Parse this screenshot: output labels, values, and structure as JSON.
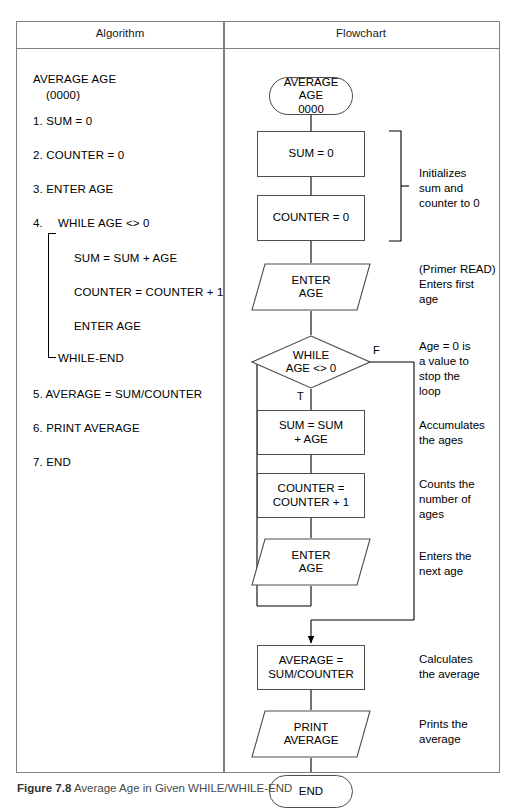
{
  "figure": {
    "caption_label": "Figure 7.8",
    "caption_text": "Average Age in Given WHILE/WHILE-END"
  },
  "table": {
    "headers": {
      "algorithm": "Algorithm",
      "flowchart": "Flowchart"
    }
  },
  "algorithm": {
    "title": "AVERAGE AGE",
    "subtitle": "(0000)",
    "steps": [
      "1. SUM = 0",
      "2. COUNTER = 0",
      "3. ENTER AGE",
      "4.",
      "WHILE AGE <> 0",
      "SUM = SUM + AGE",
      "COUNTER = COUNTER + 1",
      "ENTER AGE",
      "WHILE-END",
      "5. AVERAGE = SUM/COUNTER",
      "6. PRINT AVERAGE",
      "7. END"
    ],
    "step1": "1. SUM = 0",
    "step2": "2. COUNTER = 0",
    "step3": "3. ENTER AGE",
    "step4_num": "4.",
    "step4_while": "WHILE AGE <> 0",
    "step4_sum": "SUM = SUM + AGE",
    "step4_counter": "COUNTER = COUNTER + 1",
    "step4_enter": "ENTER AGE",
    "step4_end": "WHILE-END",
    "step5": "5. AVERAGE = SUM/COUNTER",
    "step6": "6. PRINT AVERAGE",
    "step7": "7. END"
  },
  "flowchart": {
    "nodes": {
      "start": "AVERAGE\nAGE\n0000",
      "start_line1": "AVERAGE",
      "start_line2": "AGE",
      "start_line3": "0000",
      "sum_init": "SUM = 0",
      "counter_init": "COUNTER = 0",
      "enter_age_primer_line1": "ENTER",
      "enter_age_primer_line2": "AGE",
      "decision_line1": "WHILE",
      "decision_line2": "AGE <> 0",
      "sum_accum_line1": "SUM = SUM",
      "sum_accum_line2": "+ AGE",
      "counter_inc_line1": "COUNTER =",
      "counter_inc_line2": "COUNTER + 1",
      "enter_age_next_line1": "ENTER",
      "enter_age_next_line2": "AGE",
      "average_line1": "AVERAGE =",
      "average_line2": "SUM/COUNTER",
      "print_line1": "PRINT",
      "print_line2": "AVERAGE",
      "end": "END"
    },
    "branches": {
      "true_label": "T",
      "false_label": "F"
    },
    "notes": {
      "init": "Initializes\nsum and\ncounter to 0",
      "primer": "(Primer READ)\nEnters first\nage",
      "stop": "Age = 0 is\na value to\nstop the\nloop",
      "accumulate": "Accumulates\nthe ages",
      "count": "Counts the\nnumber of\nages",
      "next": "Enters the\nnext age",
      "calculate": "Calculates\nthe average",
      "print": "Prints the\naverage"
    }
  },
  "colors": {
    "border": "#808080",
    "shape_stroke": "#4d4d4d",
    "text": "#000000"
  }
}
